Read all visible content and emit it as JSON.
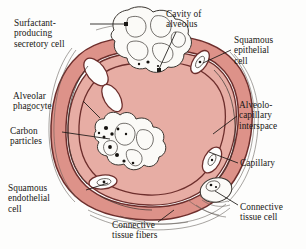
{
  "figure": {
    "subject": "alveolus",
    "colors": {
      "wall_fill": "#dd9289",
      "wall_fill_light": "#e7ada4",
      "outline": "#6d2e2c",
      "ink": "#191714",
      "cell_outline": "#3a3530",
      "background": "#fdfdfc"
    }
  },
  "labels": {
    "surfactant_cell": "Surfactant-\nproducing\nsecretory cell",
    "cavity_of_alveolus": "Cavity of\nalveolus",
    "squamous_epithelial_cell": "Squamous\nepithelial\ncell",
    "alveolo_capillary_interspace": "Alveolo-\ncapillary\ninterspace",
    "capillary": "Capillary",
    "connective_tissue_cell": "Connective\ntissue cell",
    "connective_tissue_fibers": "Connective\ntissue fibers",
    "squamous_endothelial_cell": "Squamous\nendothelial\ncell",
    "carbon_particles": "Carbon\nparticles",
    "alveolar_phagocyte": "Alveolar\nphagocyte"
  }
}
